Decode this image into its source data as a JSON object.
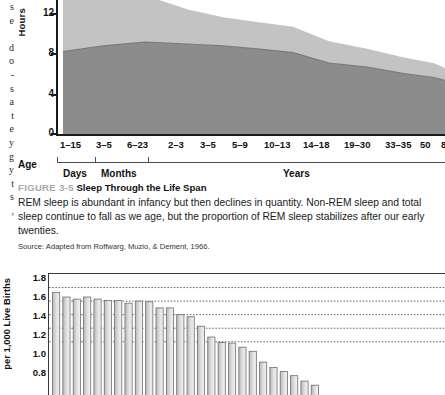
{
  "margin_text": {
    "glyphs": [
      "s",
      "e",
      "",
      "d",
      "o",
      "-",
      "s",
      "a",
      "t",
      "e",
      "y",
      "g",
      "y",
      "t",
      "s",
      ","
    ]
  },
  "figure_top": {
    "caption_figno": "FIGURE 3-5",
    "caption_title": "Sleep Through the Life Span",
    "caption_body": "REM sleep is abundant in infancy but then declines in quantity. Non-REM sleep and total sleep continue to fall as we age, but the proportion of REM sleep stabilizes after our early twenties.",
    "caption_source": "Source: Adapted from Roffwarg, Muzio, & Dement, 1966.",
    "axis_group_label": "Age",
    "unit_labels": [
      "Days",
      "Months",
      "Years"
    ]
  },
  "chart_data": [
    {
      "type": "area",
      "title": "Sleep Through the Life Span",
      "xlabel": "Age",
      "ylabel": "Hours",
      "ylim": [
        0,
        14
      ],
      "yticks": [
        0,
        4,
        8,
        12
      ],
      "ytick_labels": [
        "0",
        "4",
        "8",
        "12"
      ],
      "grid": false,
      "categories": [
        "1–15",
        "3–5",
        "6–23",
        "2–3",
        "3–5",
        "5–9",
        "10–13",
        "14–18",
        "19–30",
        "33–35",
        "50",
        "8"
      ],
      "category_units": [
        "Days",
        "Months",
        "Months",
        "Years",
        "Years",
        "Years",
        "Years",
        "Years",
        "Years",
        "Years",
        "Years",
        "Years"
      ],
      "series": [
        {
          "name": "Non-REM sleep",
          "color": "#8c8c8c",
          "values": [
            8.6,
            9.2,
            9.6,
            9.4,
            9.2,
            8.9,
            8.5,
            7.4,
            7.0,
            6.3,
            5.9,
            5.6
          ]
        },
        {
          "name": "REM sleep",
          "color": "#c3c3c3",
          "values": [
            7.6,
            6.2,
            4.9,
            3.6,
            3.0,
            2.8,
            2.7,
            2.3,
            1.9,
            1.7,
            1.5,
            1.3
          ]
        }
      ],
      "total_sleep": [
        16.2,
        15.4,
        14.5,
        13.0,
        12.2,
        11.7,
        11.2,
        9.7,
        8.9,
        8.0,
        7.4,
        6.9
      ],
      "legend": null
    },
    {
      "type": "bar",
      "ylabel": "per 1,000 Live Births",
      "ylim": [
        0.0,
        1.8
      ],
      "yticks": [
        0.8,
        1.0,
        1.2,
        1.4,
        1.6,
        1.8
      ],
      "ytick_labels": [
        "0.8",
        "1.0",
        "1.2",
        "1.4",
        "1.6",
        "1.8"
      ],
      "grid": true,
      "bar_color_left": "#b8b8b8",
      "bar_color_right": "#f2f2f2",
      "bar_edge": "#6e6e6e",
      "values": [
        1.53,
        1.46,
        1.43,
        1.46,
        1.43,
        1.41,
        1.41,
        1.37,
        1.4,
        1.39,
        1.3,
        1.3,
        1.2,
        1.17,
        1.03,
        0.87,
        0.79,
        0.78,
        0.72,
        0.66,
        0.5,
        0.42,
        0.36,
        0.3,
        0.22,
        0.16
      ]
    }
  ]
}
